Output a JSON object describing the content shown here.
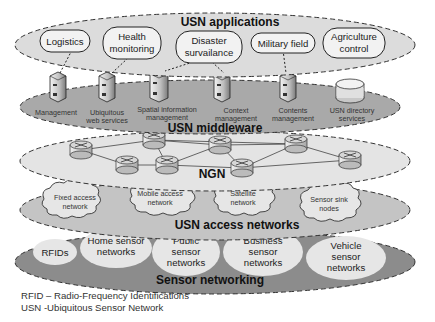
{
  "layers": {
    "applications": {
      "title": "USN applications",
      "items": [
        {
          "lines": [
            "Logistics"
          ]
        },
        {
          "lines": [
            "Health",
            "monitoring"
          ]
        },
        {
          "lines": [
            "Disaster",
            "survailance"
          ]
        },
        {
          "lines": [
            "Military field"
          ]
        },
        {
          "lines": [
            "Agriculture",
            "control"
          ]
        }
      ]
    },
    "middleware": {
      "title": "USN middleware",
      "items": [
        {
          "icon": "server-icon",
          "lines": [
            "Management"
          ]
        },
        {
          "icon": "server-icon",
          "lines": [
            "Ubiquitous",
            "web services"
          ]
        },
        {
          "icon": "server-icon",
          "lines": [
            "Spatial information",
            "management"
          ]
        },
        {
          "icon": "server-icon",
          "lines": [
            "Context",
            "management"
          ]
        },
        {
          "icon": "server-icon",
          "lines": [
            "Contents",
            "management"
          ]
        },
        {
          "icon": "database-icon",
          "lines": [
            "USN directory",
            "services"
          ]
        }
      ]
    },
    "ngn": {
      "title": "NGN",
      "router_count": 8
    },
    "access": {
      "title": "USN access networks",
      "items": [
        {
          "lines": [
            "Fixed access",
            "network"
          ]
        },
        {
          "lines": [
            "Mobile access",
            "network"
          ]
        },
        {
          "lines": [
            "Satellite",
            "network"
          ]
        },
        {
          "lines": [
            "Sensor sink",
            "nodes"
          ]
        }
      ]
    },
    "sensor": {
      "title": "Sensor networking",
      "items": [
        {
          "lines": [
            "RFIDs"
          ]
        },
        {
          "lines": [
            "Home sensor",
            "networks"
          ]
        },
        {
          "lines": [
            "Public",
            "sensor",
            "networks"
          ]
        },
        {
          "lines": [
            "Business",
            "sensor",
            "networks"
          ]
        },
        {
          "lines": [
            "Vehicle",
            "sensor",
            "networks"
          ]
        }
      ]
    }
  },
  "legend": [
    "RFID – Radio-Frequency Identifications",
    "USN -Ubiquitous Sensor Network"
  ],
  "colors": {
    "applications_fill": "#dcdcdc",
    "middleware_fill": "#a9a9a9",
    "ngn_fill": "#e4e4e4",
    "access_fill": "#c4c4c4",
    "sensor_fill": "#8c8c8c",
    "bubble_fill": "#e6e6e6"
  }
}
